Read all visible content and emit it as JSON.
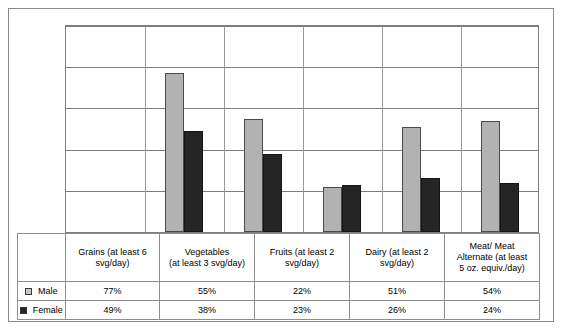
{
  "chart_data": {
    "type": "bar",
    "title": "",
    "subtitle": "",
    "xlabel": "",
    "ylabel": "",
    "ylim": [
      0,
      100
    ],
    "grid": true,
    "gridlines": [
      20,
      40,
      60,
      80,
      100
    ],
    "axis_tick_labels": [],
    "legend_position": "table-left",
    "categories": [
      "Grains (at least 6 svg/day)",
      "Vegetables (at least 3 svg/day)",
      "Fruits (at least 2 svg/day)",
      "Dairy (at least 2 svg/day)",
      "Meat/ Meat Alternate (at least 5 oz. equiv./day)"
    ],
    "series": [
      {
        "name": "Male",
        "values": [
          77,
          55,
          22,
          51,
          54
        ],
        "color": "#b2b2b2"
      },
      {
        "name": "Female",
        "values": [
          49,
          38,
          23,
          26,
          24
        ],
        "color": "#252525"
      }
    ],
    "value_suffix": "%"
  },
  "table": {
    "category_labels": [
      [
        "Grains (at least 6",
        "svg/day)"
      ],
      [
        "Vegetables",
        "(at least 3 svg/day)"
      ],
      [
        "Fruits (at least 2",
        "svg/day)"
      ],
      [
        "Dairy (at least 2",
        "svg/day)"
      ],
      [
        "Meat/ Meat",
        "Alternate (at least",
        "5 oz. equiv./day)"
      ]
    ],
    "rows": [
      {
        "label": "Male",
        "swatch": "light-square-icon",
        "values": [
          "77%",
          "55%",
          "22%",
          "51%",
          "54%"
        ]
      },
      {
        "label": "Female",
        "swatch": "dark-square-icon",
        "values": [
          "49%",
          "38%",
          "23%",
          "26%",
          "24%"
        ]
      }
    ]
  },
  "colors": {
    "male_bar": "#b2b2b2",
    "female_bar": "#252525",
    "gridline": "#7d7d7d",
    "border": "#8a8a8a"
  }
}
